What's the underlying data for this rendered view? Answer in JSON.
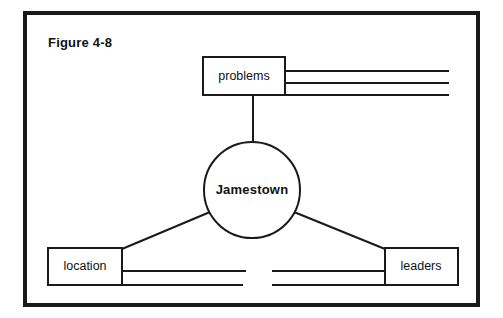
{
  "figure": {
    "title": "Figure 4-8",
    "type": "concept-web-graphic-organizer",
    "background_color": "#ffffff",
    "ink_color": "#1a1a1a"
  },
  "center_node": {
    "label": "Jamestown",
    "shape": "circle",
    "cx": 252,
    "cy": 190,
    "r": 48
  },
  "branch_nodes": [
    {
      "id": "problems",
      "label": "problems",
      "shape": "rect",
      "x": 203,
      "y": 57,
      "w": 82,
      "h": 38,
      "writing_lines": 3,
      "lines_direction": "right"
    },
    {
      "id": "location",
      "label": "location",
      "shape": "rect",
      "x": 48,
      "y": 248,
      "w": 74,
      "h": 37,
      "writing_lines": 2,
      "lines_direction": "right"
    },
    {
      "id": "leaders",
      "label": "leaders",
      "shape": "rect",
      "x": 385,
      "y": 248,
      "w": 73,
      "h": 37,
      "writing_lines": 2,
      "lines_direction": "left"
    }
  ],
  "connectors": [
    {
      "id": "center-to-problems",
      "from": "Jamestown",
      "to": "problems"
    },
    {
      "id": "center-to-location",
      "from": "Jamestown",
      "to": "location"
    },
    {
      "id": "center-to-leaders",
      "from": "Jamestown",
      "to": "leaders"
    }
  ],
  "frame": {
    "x": 23,
    "y": 11,
    "w": 457,
    "h": 296
  }
}
